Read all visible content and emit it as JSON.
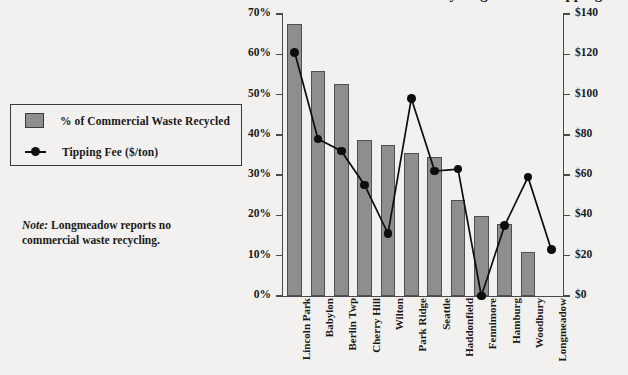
{
  "title_partial": "Commercial Waste Recycling Rates vs. Tipping Fees",
  "legend": {
    "items": [
      {
        "label": "% of Commercial Waste Recycled",
        "icon": "gray-square-swatch",
        "color": "#8e8e8e"
      },
      {
        "label": "Tipping Fee ($/ton)",
        "icon": "line-marker-swatch",
        "color": "#0d0d0d"
      }
    ]
  },
  "note": {
    "label": "Note:",
    "text": "Longmeadow reports no commercial waste recycling."
  },
  "axes": {
    "left_ticks": [
      "0%",
      "10%",
      "20%",
      "30%",
      "40%",
      "50%",
      "60%",
      "70%"
    ],
    "right_ticks": [
      "$0",
      "$20",
      "$40",
      "$60",
      "$80",
      "$100",
      "$120",
      "$140"
    ]
  },
  "chart_data": {
    "type": "bar",
    "title": "Commercial Waste Recycling Rates vs. Tipping Fees",
    "xlabel": "",
    "ylabel": "% of Commercial Waste Recycled",
    "y2label": "Tipping Fee ($/ton)",
    "ylim": [
      0,
      70
    ],
    "y2lim": [
      0,
      140
    ],
    "ytick_step": 10,
    "y2tick_step": 20,
    "grid": false,
    "legend_position": "left-outside",
    "categories": [
      "Lincoln Park",
      "Babylon",
      "Berlin Twp",
      "Cherry Hill",
      "Wilton",
      "Park Ridge",
      "Seattle",
      "Haddonfield",
      "Fennimore",
      "Hamburg",
      "Woodbury",
      "Longmeadow"
    ],
    "series": [
      {
        "name": "% of Commercial Waste Recycled",
        "type": "bar",
        "axis": "left",
        "unit": "%",
        "color": "#8e8e8e",
        "values": [
          67.6,
          55.8,
          52.6,
          38.7,
          37.5,
          35.6,
          34.5,
          23.8,
          19.8,
          17.9,
          10.9,
          0
        ]
      },
      {
        "name": "Tipping Fee ($/ton)",
        "type": "line",
        "axis": "right",
        "unit": "$",
        "color": "#0d0d0d",
        "values": [
          121,
          78,
          72,
          55,
          31,
          98,
          62,
          63,
          0,
          35,
          59,
          23
        ]
      }
    ]
  }
}
